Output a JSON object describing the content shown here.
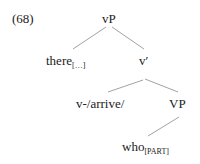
{
  "example_number": "(68)",
  "tree": {
    "root": {
      "label": "vP"
    },
    "spec": {
      "label": "there",
      "subscript": "[…]"
    },
    "vbar": {
      "label": "v′"
    },
    "head": {
      "label": "v-/arrive/"
    },
    "vp": {
      "label": "VP"
    },
    "comp": {
      "label": "who",
      "subscript": "[PART]"
    }
  }
}
